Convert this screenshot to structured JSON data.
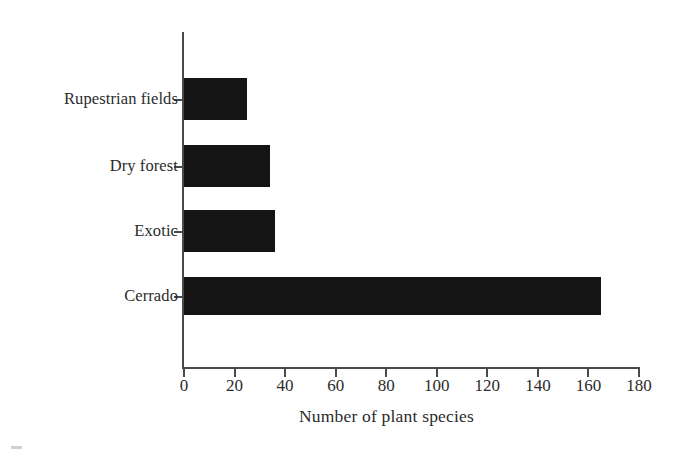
{
  "chart_data": {
    "type": "bar",
    "orientation": "horizontal",
    "title": "",
    "xlabel": "Number of plant species",
    "ylabel": "",
    "categories": [
      "Rupestrian fields",
      "Dry forest",
      "Exotic",
      "Cerrado"
    ],
    "values": [
      25,
      34,
      36,
      165
    ],
    "xlim": [
      0,
      180
    ],
    "xticks": [
      0,
      20,
      40,
      60,
      80,
      100,
      120,
      140,
      160,
      180
    ],
    "xtick_labels": [
      "0",
      "20",
      "40",
      "60",
      "80",
      "100",
      "120",
      "140",
      "160",
      "180"
    ],
    "grid": false,
    "legend": null,
    "bar_color": "#141414",
    "axis_color": "#4a4a4a",
    "background_color": "#ffffff",
    "series": [
      {
        "name": "Number of plant species",
        "points": [
          {
            "category": "Rupestrian fields",
            "value": 25
          },
          {
            "category": "Dry forest",
            "value": 34
          },
          {
            "category": "Exotic",
            "value": 36
          },
          {
            "category": "Cerrado",
            "value": 165
          }
        ]
      }
    ]
  }
}
